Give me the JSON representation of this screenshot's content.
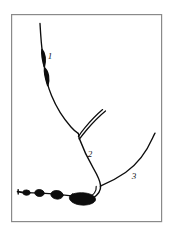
{
  "figure": {
    "domain": "Diagram",
    "title": "",
    "caption": "",
    "background_color": "#ffffff",
    "frame": {
      "name": "figure-border",
      "stroke_color": "#8a8a8a",
      "fill_color": "#ffffff",
      "stroke_width": 1.2,
      "x": 11,
      "y": 14,
      "width": 151,
      "height": 208
    },
    "ink_color": "#0d0d0d",
    "labels": [
      {
        "name": "callout-label-1",
        "text": "1",
        "x": 50,
        "y": 59,
        "refers_to": "swollen spindle-shaped nodes on the upright stem"
      },
      {
        "name": "callout-label-2",
        "text": "2",
        "x": 90,
        "y": 157,
        "refers_to": "paired sheath lines at the stem fork"
      },
      {
        "name": "callout-label-3",
        "text": "3",
        "x": 133,
        "y": 179,
        "refers_to": "lateral branch rising to the right"
      }
    ],
    "structures": [
      {
        "name": "upright-stem",
        "type": "stroke",
        "description": "thin stem from top of frame curving down to the fork"
      },
      {
        "name": "stem-node-upper",
        "type": "filled-spindle",
        "description": "upper swollen node on the stem",
        "cx": 43,
        "cy": 58
      },
      {
        "name": "stem-node-lower",
        "type": "filled-spindle",
        "description": "lower swollen node on the stem",
        "cx": 46,
        "cy": 76
      },
      {
        "name": "sheath-double-line",
        "type": "stroke-pair",
        "description": "two parallel curved lines forming a sheath above label 2"
      },
      {
        "name": "lower-stem",
        "type": "stroke",
        "description": "stem descending from the fork to the basal cluster"
      },
      {
        "name": "lateral-branch",
        "type": "stroke",
        "description": "branch curving up and to the right toward the frame edge"
      },
      {
        "name": "rhizome-chain",
        "type": "filled-chain",
        "description": "horizontal chain of four swollen bulbs increasing in size to the right",
        "bulbs": [
          {
            "cx": 26,
            "cy": 193,
            "rx": 4.0,
            "ry": 3.0
          },
          {
            "cx": 39,
            "cy": 192,
            "rx": 5.0,
            "ry": 3.8
          },
          {
            "cx": 57,
            "cy": 194,
            "rx": 6.0,
            "ry": 4.4
          },
          {
            "cx": 84,
            "cy": 196,
            "rx": 11.5,
            "ry": 7.5
          }
        ]
      },
      {
        "name": "rhizome-tail",
        "type": "stroke",
        "description": "short tapering tail at the left end of the rhizome"
      }
    ]
  }
}
